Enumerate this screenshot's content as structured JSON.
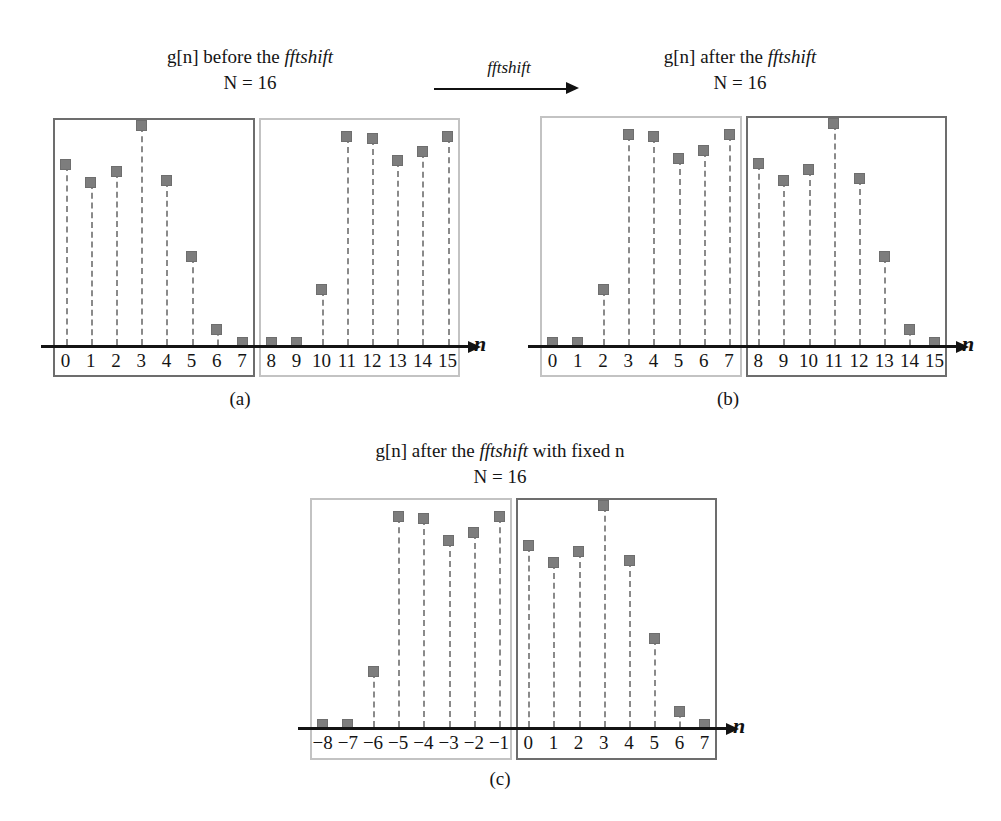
{
  "figure": {
    "shift_arrow_label": "fftshift",
    "marker_color": "#7d7d7d",
    "stem_color": "#8a8a8a",
    "axis_color": "#141414",
    "panel_dark_color": "#6d6d6d",
    "panel_light_color": "#c3c3c3"
  },
  "panels": [
    {
      "id": "a",
      "caption": "(a)",
      "title_main_pre": "g[n] before the ",
      "title_main_ital": "fftshift",
      "title_main_post": "",
      "title_sub": "N = 16",
      "axis_name": "n",
      "left_box_style": "dark",
      "right_box_style": "light",
      "tick_labels": [
        "0",
        "1",
        "2",
        "3",
        "4",
        "5",
        "6",
        "7",
        "8",
        "9",
        "10",
        "11",
        "12",
        "13",
        "14",
        "15"
      ]
    },
    {
      "id": "b",
      "caption": "(b)",
      "title_main_pre": "g[n] after the ",
      "title_main_ital": "fftshift",
      "title_main_post": "",
      "title_sub": "N = 16",
      "axis_name": "n",
      "left_box_style": "light",
      "right_box_style": "dark",
      "tick_labels": [
        "0",
        "1",
        "2",
        "3",
        "4",
        "5",
        "6",
        "7",
        "8",
        "9",
        "10",
        "11",
        "12",
        "13",
        "14",
        "15"
      ]
    },
    {
      "id": "c",
      "caption": "(c)",
      "title_main_pre": "g[n] after the ",
      "title_main_ital": "fftshift",
      "title_main_post": " with fixed n",
      "title_sub": "N = 16",
      "axis_name": "n",
      "left_box_style": "light",
      "right_box_style": "dark",
      "tick_labels": [
        "−8",
        "−7",
        "−6",
        "−5",
        "−4",
        "−3",
        "−2",
        "−1",
        "0",
        "1",
        "2",
        "3",
        "4",
        "5",
        "6",
        "7"
      ]
    }
  ],
  "chart_data": [
    {
      "type": "scatter",
      "id": "a",
      "title": "g[n] before the fftshift, N = 16",
      "xlabel": "n",
      "ylabel": "",
      "grid": false,
      "legend": "none",
      "xlim": [
        -0.5,
        15.5
      ],
      "ylim": [
        0,
        1.0
      ],
      "x": [
        0,
        1,
        2,
        3,
        4,
        5,
        6,
        7,
        8,
        9,
        10,
        11,
        12,
        13,
        14,
        15
      ],
      "xtick_labels": [
        "0",
        "1",
        "2",
        "3",
        "4",
        "5",
        "6",
        "7",
        "8",
        "9",
        "10",
        "11",
        "12",
        "13",
        "14",
        "15"
      ],
      "values": [
        0.82,
        0.74,
        0.79,
        1.0,
        0.75,
        0.4,
        0.07,
        0.01,
        0.01,
        0.01,
        0.25,
        0.95,
        0.94,
        0.84,
        0.88,
        0.95
      ]
    },
    {
      "type": "scatter",
      "id": "b",
      "title": "g[n] after the fftshift, N = 16",
      "xlabel": "n",
      "ylabel": "",
      "grid": false,
      "legend": "none",
      "xlim": [
        -0.5,
        15.5
      ],
      "ylim": [
        0,
        1.0
      ],
      "x": [
        0,
        1,
        2,
        3,
        4,
        5,
        6,
        7,
        8,
        9,
        10,
        11,
        12,
        13,
        14,
        15
      ],
      "xtick_labels": [
        "0",
        "1",
        "2",
        "3",
        "4",
        "5",
        "6",
        "7",
        "8",
        "9",
        "10",
        "11",
        "12",
        "13",
        "14",
        "15"
      ],
      "values": [
        0.01,
        0.01,
        0.25,
        0.95,
        0.94,
        0.84,
        0.88,
        0.95,
        0.82,
        0.74,
        0.79,
        1.0,
        0.75,
        0.4,
        0.07,
        0.01
      ]
    },
    {
      "type": "scatter",
      "id": "c",
      "title": "g[n] after the fftshift with fixed n, N = 16",
      "xlabel": "n",
      "ylabel": "",
      "grid": false,
      "legend": "none",
      "xlim": [
        -8.5,
        7.5
      ],
      "ylim": [
        0,
        1.0
      ],
      "x": [
        -8,
        -7,
        -6,
        -5,
        -4,
        -3,
        -2,
        -1,
        0,
        1,
        2,
        3,
        4,
        5,
        6,
        7
      ],
      "xtick_labels": [
        "−8",
        "−7",
        "−6",
        "−5",
        "−4",
        "−3",
        "−2",
        "−1",
        "0",
        "1",
        "2",
        "3",
        "4",
        "5",
        "6",
        "7"
      ],
      "values": [
        0.01,
        0.01,
        0.25,
        0.95,
        0.94,
        0.84,
        0.88,
        0.95,
        0.82,
        0.74,
        0.79,
        1.0,
        0.75,
        0.4,
        0.07,
        0.01
      ]
    }
  ]
}
